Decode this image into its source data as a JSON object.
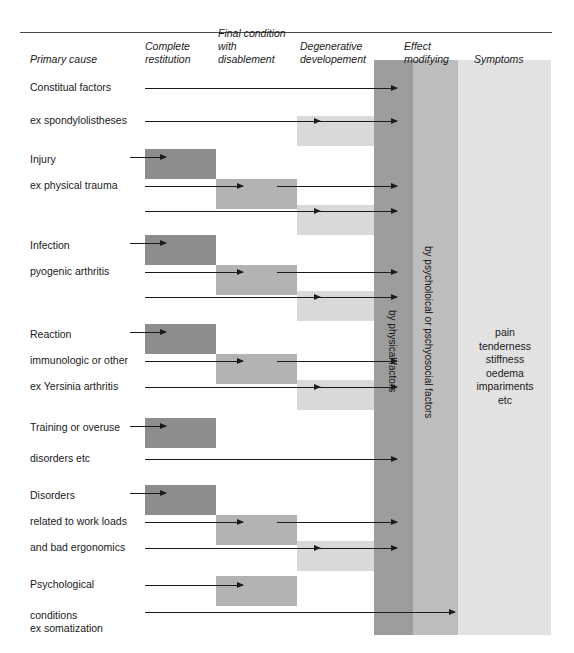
{
  "figure": {
    "colors": {
      "box_dark": "#8d8d8d",
      "box_medium": "#b3b3b3",
      "box_light": "#d9d9d9",
      "band_physical": "#9d9d9d",
      "band_psychosocial": "#bdbdbd",
      "band_symptoms": "#e2e2e2",
      "arrow": "#1b1b1b",
      "rule": "#4a4a4a",
      "text": "#1a1a1a"
    }
  },
  "columns": [
    {
      "key": "primary_cause",
      "label": "Primary cause"
    },
    {
      "key": "complete_restitution",
      "label": "Complete\nrestitution"
    },
    {
      "key": "final_condition",
      "label": "Final condition\nwith\ndisablement"
    },
    {
      "key": "degenerative",
      "label": "Degenerative\ndevelopement"
    },
    {
      "key": "effect_modifying",
      "label": "Effect\nmodifying"
    },
    {
      "key": "symptoms",
      "label": "Symptoms"
    }
  ],
  "bands": {
    "physical": {
      "caption": "by physical factors"
    },
    "psychosocial": {
      "caption": "by psycholoical or pschyosocial factors"
    }
  },
  "groups": [
    {
      "key": "constitual",
      "rows": [
        {
          "label": "Constitual factors",
          "boxes": [],
          "arrows": [
            "to_effect"
          ]
        },
        {
          "label": "ex spondylolistheses",
          "boxes": [
            "light"
          ],
          "arrows": [
            "to_light",
            "to_effect"
          ]
        }
      ]
    },
    {
      "key": "injury",
      "rows": [
        {
          "label": "Injury",
          "boxes": [
            "dark"
          ],
          "arrows": [
            "to_dark"
          ]
        },
        {
          "label": "ex physical trauma",
          "boxes": [
            "medium"
          ],
          "arrows": [
            "to_medium",
            "to_effect"
          ]
        },
        {
          "label": "",
          "boxes": [
            "light"
          ],
          "arrows": [
            "to_light",
            "to_effect"
          ]
        }
      ]
    },
    {
      "key": "infection",
      "rows": [
        {
          "label": "Infection",
          "boxes": [
            "dark"
          ],
          "arrows": [
            "to_dark"
          ]
        },
        {
          "label": "pyogenic arthritis",
          "boxes": [
            "medium"
          ],
          "arrows": [
            "to_medium",
            "to_effect"
          ]
        },
        {
          "label": "",
          "boxes": [
            "light"
          ],
          "arrows": [
            "to_light",
            "to_effect"
          ]
        }
      ]
    },
    {
      "key": "reaction",
      "rows": [
        {
          "label": "Reaction",
          "boxes": [
            "dark"
          ],
          "arrows": [
            "to_dark"
          ]
        },
        {
          "label": "immunologic or other",
          "boxes": [
            "medium"
          ],
          "arrows": [
            "to_medium",
            "to_effect"
          ]
        },
        {
          "label": "ex Yersinia arthritis",
          "boxes": [
            "light"
          ],
          "arrows": [
            "to_light",
            "to_effect"
          ]
        }
      ]
    },
    {
      "key": "training",
      "rows": [
        {
          "label": "Training or overuse",
          "boxes": [
            "dark"
          ],
          "arrows": [
            "to_dark"
          ]
        },
        {
          "label": "disorders etc",
          "boxes": [],
          "arrows": [
            "to_effect_long"
          ]
        }
      ]
    },
    {
      "key": "disorders",
      "rows": [
        {
          "label": "Disorders",
          "boxes": [
            "dark"
          ],
          "arrows": [
            "to_dark"
          ]
        },
        {
          "label": "related to work loads",
          "boxes": [
            "medium"
          ],
          "arrows": [
            "to_medium",
            "to_effect"
          ]
        },
        {
          "label": "and bad ergonomics",
          "boxes": [
            "light"
          ],
          "arrows": [
            "to_light",
            "to_effect"
          ]
        }
      ]
    },
    {
      "key": "psychological",
      "rows": [
        {
          "label": "Psychological",
          "boxes": [
            "medium"
          ],
          "arrows": [
            "to_medium"
          ]
        },
        {
          "label": "conditions\nex somatization",
          "boxes": [],
          "arrows": [
            "to_effect_long"
          ]
        }
      ]
    }
  ],
  "symptoms": {
    "items": "pain\ntenderness\nstiffness\noedema\nimpariments\netc"
  }
}
